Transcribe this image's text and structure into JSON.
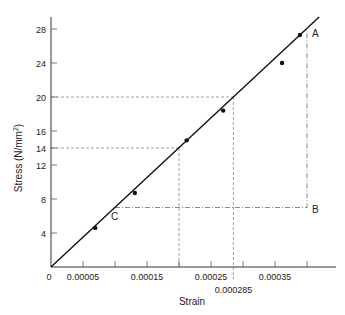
{
  "chart_data": {
    "type": "line",
    "title": "",
    "xlabel": "Strain",
    "ylabel": "Stress (N/mm²)",
    "ylabel_base": "Stress (N/mm",
    "ylabel_sup": "2",
    "ylabel_close": ")",
    "xlim": [
      0,
      0.00045
    ],
    "ylim": [
      0,
      29
    ],
    "grid": false,
    "x_ticks": [
      5e-05,
      0.0001,
      0.00015,
      0.0002,
      0.00025,
      0.0003,
      0.00035,
      0.0004
    ],
    "x_tick_labels": [
      {
        "value": 0,
        "label": "0"
      },
      {
        "value": 5e-05,
        "label": "0.00005"
      },
      {
        "value": 0.00015,
        "label": "0.00015"
      },
      {
        "value": 0.00025,
        "label": "0.00025"
      },
      {
        "value": 0.00035,
        "label": "0.00035"
      },
      {
        "value": 0.000285,
        "label": "0.000285"
      }
    ],
    "y_ticks": [
      4,
      8,
      12,
      14,
      16,
      20,
      24,
      28
    ],
    "y_tick_labels": [
      "4",
      "8",
      "12",
      "14",
      "16",
      "20",
      "24",
      "28"
    ],
    "series": [
      {
        "name": "measured points",
        "type": "scatter",
        "x": [
          6.9e-05,
          0.000131,
          0.000212,
          0.000269,
          0.000361,
          0.000389
        ],
        "y": [
          4.6,
          8.7,
          14.9,
          18.4,
          24.0,
          27.3
        ]
      },
      {
        "name": "best fit line",
        "type": "line",
        "x": [
          0,
          0.000419
        ],
        "y": [
          0,
          29.4
        ]
      }
    ],
    "annotations": [
      {
        "label": "A",
        "x": 0.0004,
        "y": 27.5
      },
      {
        "label": "B",
        "x": 0.0004,
        "y": 7
      },
      {
        "label": "C",
        "x": 0.0001,
        "y": 7
      },
      {
        "type": "dashed-guide",
        "from_y": 20,
        "to_x": 0.000285
      },
      {
        "type": "dashed-guide",
        "from_y": 14,
        "to_x": 0.0002
      },
      {
        "type": "dash-dot",
        "segment": "C-B",
        "y": 7
      },
      {
        "type": "dash-dot",
        "segment": "A-B",
        "x": 0.0004
      }
    ]
  }
}
